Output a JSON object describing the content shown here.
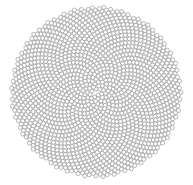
{
  "figure": {
    "type": "phyllotaxis-pattern",
    "model": "vogel",
    "point_count": 1600,
    "divergence_angle_deg": 137.508,
    "colors": {
      "background": "#ffffff",
      "seed_fill": "#ffffff",
      "seed_stroke": "#8a8a8a"
    }
  }
}
